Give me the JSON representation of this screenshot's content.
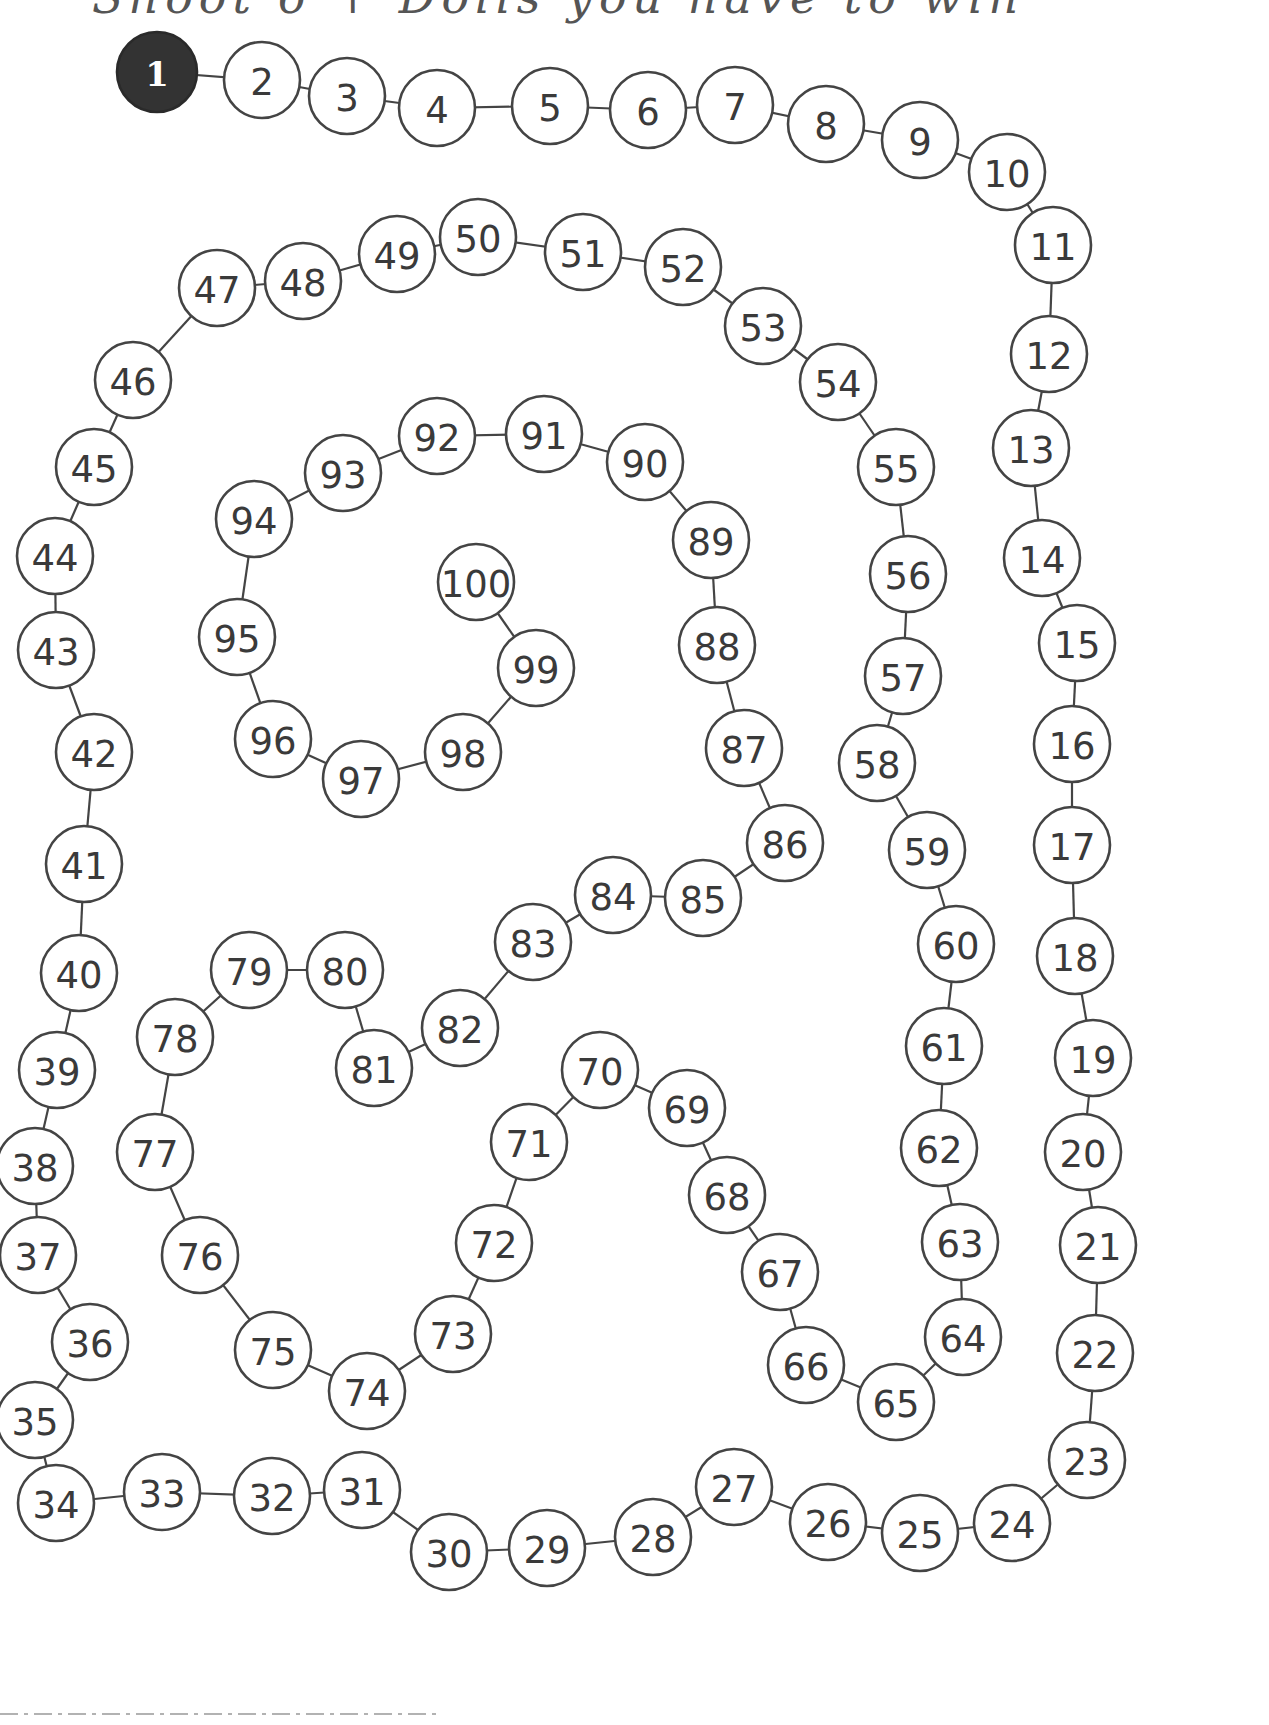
{
  "header": {
    "instruction_text": "Shoot 6 + Dolls you have to win"
  },
  "colors": {
    "start_fill": "#333333",
    "outline": "#444444",
    "text": "#3a3a3a",
    "background": "#ffffff"
  },
  "board": {
    "start_square": 1,
    "end_square": 100,
    "circle_radius": 38,
    "squares": [
      {
        "n": "1",
        "x": 157,
        "y": 72
      },
      {
        "n": "2",
        "x": 262,
        "y": 80
      },
      {
        "n": "3",
        "x": 347,
        "y": 96
      },
      {
        "n": "4",
        "x": 437,
        "y": 108
      },
      {
        "n": "5",
        "x": 550,
        "y": 106
      },
      {
        "n": "6",
        "x": 648,
        "y": 110
      },
      {
        "n": "7",
        "x": 735,
        "y": 105
      },
      {
        "n": "8",
        "x": 826,
        "y": 124
      },
      {
        "n": "9",
        "x": 920,
        "y": 140
      },
      {
        "n": "10",
        "x": 1007,
        "y": 172
      },
      {
        "n": "11",
        "x": 1053,
        "y": 245
      },
      {
        "n": "12",
        "x": 1049,
        "y": 354
      },
      {
        "n": "13",
        "x": 1031,
        "y": 448
      },
      {
        "n": "14",
        "x": 1042,
        "y": 558
      },
      {
        "n": "15",
        "x": 1077,
        "y": 643
      },
      {
        "n": "16",
        "x": 1072,
        "y": 744
      },
      {
        "n": "17",
        "x": 1072,
        "y": 845
      },
      {
        "n": "18",
        "x": 1075,
        "y": 956
      },
      {
        "n": "19",
        "x": 1093,
        "y": 1058
      },
      {
        "n": "20",
        "x": 1083,
        "y": 1152
      },
      {
        "n": "21",
        "x": 1098,
        "y": 1245
      },
      {
        "n": "22",
        "x": 1095,
        "y": 1353
      },
      {
        "n": "23",
        "x": 1087,
        "y": 1460
      },
      {
        "n": "24",
        "x": 1012,
        "y": 1523
      },
      {
        "n": "25",
        "x": 920,
        "y": 1533
      },
      {
        "n": "26",
        "x": 828,
        "y": 1522
      },
      {
        "n": "27",
        "x": 734,
        "y": 1487
      },
      {
        "n": "28",
        "x": 653,
        "y": 1537
      },
      {
        "n": "29",
        "x": 547,
        "y": 1548
      },
      {
        "n": "30",
        "x": 449,
        "y": 1552
      },
      {
        "n": "31",
        "x": 362,
        "y": 1490
      },
      {
        "n": "32",
        "x": 272,
        "y": 1496
      },
      {
        "n": "33",
        "x": 162,
        "y": 1492
      },
      {
        "n": "34",
        "x": 56,
        "y": 1503
      },
      {
        "n": "35",
        "x": 35,
        "y": 1420
      },
      {
        "n": "36",
        "x": 90,
        "y": 1342
      },
      {
        "n": "37",
        "x": 38,
        "y": 1255
      },
      {
        "n": "38",
        "x": 35,
        "y": 1166
      },
      {
        "n": "39",
        "x": 57,
        "y": 1070
      },
      {
        "n": "40",
        "x": 79,
        "y": 973
      },
      {
        "n": "41",
        "x": 84,
        "y": 864
      },
      {
        "n": "42",
        "x": 94,
        "y": 752
      },
      {
        "n": "43",
        "x": 56,
        "y": 650
      },
      {
        "n": "44",
        "x": 55,
        "y": 556
      },
      {
        "n": "45",
        "x": 94,
        "y": 467
      },
      {
        "n": "46",
        "x": 133,
        "y": 380
      },
      {
        "n": "47",
        "x": 217,
        "y": 288
      },
      {
        "n": "48",
        "x": 303,
        "y": 281
      },
      {
        "n": "49",
        "x": 397,
        "y": 254
      },
      {
        "n": "50",
        "x": 478,
        "y": 237
      },
      {
        "n": "51",
        "x": 583,
        "y": 252
      },
      {
        "n": "52",
        "x": 683,
        "y": 267
      },
      {
        "n": "53",
        "x": 763,
        "y": 326
      },
      {
        "n": "54",
        "x": 838,
        "y": 382
      },
      {
        "n": "55",
        "x": 896,
        "y": 467
      },
      {
        "n": "56",
        "x": 908,
        "y": 574
      },
      {
        "n": "57",
        "x": 903,
        "y": 676
      },
      {
        "n": "58",
        "x": 877,
        "y": 763
      },
      {
        "n": "59",
        "x": 927,
        "y": 850
      },
      {
        "n": "60",
        "x": 956,
        "y": 944
      },
      {
        "n": "61",
        "x": 944,
        "y": 1046
      },
      {
        "n": "62",
        "x": 939,
        "y": 1148
      },
      {
        "n": "63",
        "x": 960,
        "y": 1242
      },
      {
        "n": "64",
        "x": 963,
        "y": 1337
      },
      {
        "n": "65",
        "x": 896,
        "y": 1402
      },
      {
        "n": "66",
        "x": 806,
        "y": 1365
      },
      {
        "n": "67",
        "x": 780,
        "y": 1272
      },
      {
        "n": "68",
        "x": 727,
        "y": 1195
      },
      {
        "n": "69",
        "x": 687,
        "y": 1108
      },
      {
        "n": "70",
        "x": 600,
        "y": 1070
      },
      {
        "n": "71",
        "x": 529,
        "y": 1142
      },
      {
        "n": "72",
        "x": 494,
        "y": 1243
      },
      {
        "n": "73",
        "x": 453,
        "y": 1334
      },
      {
        "n": "74",
        "x": 367,
        "y": 1391
      },
      {
        "n": "75",
        "x": 273,
        "y": 1350
      },
      {
        "n": "76",
        "x": 200,
        "y": 1255
      },
      {
        "n": "77",
        "x": 155,
        "y": 1152
      },
      {
        "n": "78",
        "x": 175,
        "y": 1037
      },
      {
        "n": "79",
        "x": 249,
        "y": 970
      },
      {
        "n": "80",
        "x": 345,
        "y": 970
      },
      {
        "n": "81",
        "x": 374,
        "y": 1068
      },
      {
        "n": "82",
        "x": 460,
        "y": 1028
      },
      {
        "n": "83",
        "x": 533,
        "y": 942
      },
      {
        "n": "84",
        "x": 613,
        "y": 895
      },
      {
        "n": "85",
        "x": 703,
        "y": 898
      },
      {
        "n": "86",
        "x": 785,
        "y": 843
      },
      {
        "n": "87",
        "x": 744,
        "y": 748
      },
      {
        "n": "88",
        "x": 717,
        "y": 645
      },
      {
        "n": "89",
        "x": 711,
        "y": 540
      },
      {
        "n": "90",
        "x": 645,
        "y": 462
      },
      {
        "n": "91",
        "x": 544,
        "y": 434
      },
      {
        "n": "92",
        "x": 437,
        "y": 436
      },
      {
        "n": "93",
        "x": 343,
        "y": 473
      },
      {
        "n": "94",
        "x": 254,
        "y": 519
      },
      {
        "n": "95",
        "x": 237,
        "y": 637
      },
      {
        "n": "96",
        "x": 273,
        "y": 739
      },
      {
        "n": "97",
        "x": 361,
        "y": 779
      },
      {
        "n": "98",
        "x": 463,
        "y": 752
      },
      {
        "n": "99",
        "x": 536,
        "y": 668
      },
      {
        "n": "100",
        "x": 476,
        "y": 582
      }
    ]
  }
}
